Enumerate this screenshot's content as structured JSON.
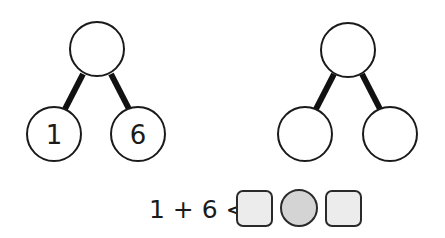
{
  "part_whole_models": [
    {
      "whole": "",
      "parts": [
        "1",
        "6"
      ]
    },
    {
      "whole": "",
      "parts": [
        "",
        ""
      ]
    }
  ],
  "equation": {
    "expression": "1 + 6 <",
    "answer_slots": [
      {
        "shape": "square",
        "value": ""
      },
      {
        "shape": "circle",
        "value": ""
      },
      {
        "shape": "square",
        "value": ""
      }
    ]
  },
  "colors": {
    "square_fill": "#ececec",
    "circle_fill": "#d4d4d4",
    "stroke": "#1a1a1a"
  }
}
